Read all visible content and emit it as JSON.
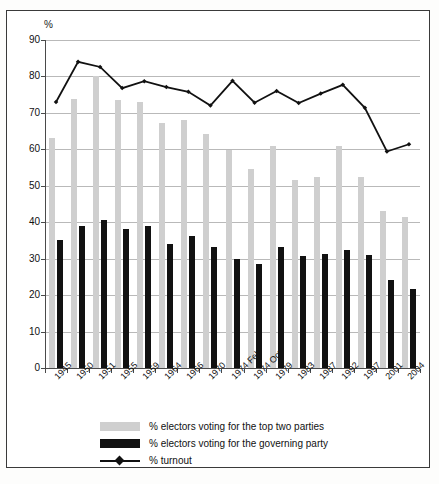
{
  "chart_data": {
    "type": "bar",
    "title": "",
    "subtitle": "",
    "xlabel": "",
    "ylabel": "%",
    "ylim": [
      0,
      90
    ],
    "ytick_step": 10,
    "yticks": [
      0,
      10,
      20,
      30,
      40,
      50,
      60,
      70,
      80,
      90
    ],
    "grid": true,
    "legend_position": "bottom-left",
    "categories": [
      "1945",
      "1950",
      "1951",
      "1955",
      "1959",
      "1964",
      "1966",
      "1970",
      "1974 Feb",
      "1974 Oct",
      "1979",
      "1983",
      "1987",
      "1992",
      "1997",
      "2001",
      "2004"
    ],
    "series": [
      {
        "name": "% electors voting for the top two parties",
        "type": "bar",
        "color": "#cfcfcf",
        "values": [
          63.2,
          73.7,
          80.0,
          73.6,
          73.1,
          67.3,
          68.0,
          64.3,
          59.8,
          54.5,
          60.8,
          51.5,
          52.3,
          60.9,
          52.5,
          43.0,
          41.5
        ]
      },
      {
        "name": "% electors voting for the governing party",
        "type": "bar",
        "color": "#111111",
        "values": [
          35.0,
          39.0,
          40.6,
          38.2,
          39.0,
          34.1,
          36.3,
          33.3,
          29.9,
          28.5,
          33.3,
          30.8,
          31.3,
          32.5,
          31.0,
          24.2,
          21.6
        ]
      },
      {
        "name": "% turnout",
        "type": "line",
        "color": "#111111",
        "marker": "diamond",
        "values": [
          73.0,
          84.0,
          82.6,
          76.8,
          78.7,
          77.1,
          75.8,
          72.0,
          78.8,
          72.8,
          76.0,
          72.7,
          75.3,
          77.7,
          71.4,
          59.4,
          61.4
        ]
      }
    ]
  },
  "axis": {
    "y_unit_label": "%"
  },
  "legend": {
    "items": [
      {
        "label": "% electors voting for the top two parties",
        "swatch": "grey-swatch"
      },
      {
        "label": "% electors voting for the governing party",
        "swatch": "black-swatch"
      },
      {
        "label": "% turnout",
        "swatch": "line-marker-swatch"
      }
    ]
  }
}
